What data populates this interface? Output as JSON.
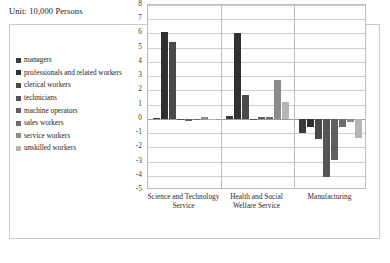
{
  "unit_label": "Unit: 10,000 Persons",
  "caption": "",
  "colors": {
    "series": [
      "#3b3b3b",
      "#303030",
      "#4a4a4a",
      "#555555",
      "#5f5f5f",
      "#6b6b6b",
      "#8c8c8c",
      "#b5b5b5"
    ],
    "gridline": "#cfcfcf",
    "axis": "#bdbdbd",
    "frame": "#c9c9c9"
  },
  "chart_data": {
    "type": "bar",
    "title": "",
    "subtitle": "",
    "xlabel": "",
    "ylabel": "",
    "unit": "10,000 Persons",
    "ylim": [
      -5,
      8
    ],
    "yticks": [
      8,
      7,
      6,
      5,
      4,
      3,
      2,
      1,
      0,
      -1,
      -2,
      -3,
      -4,
      -5
    ],
    "grid": true,
    "legend_position": "left",
    "categories": [
      "Science and Technology Service",
      "Health and Social Welfare Service",
      "Manufacturing"
    ],
    "series": [
      {
        "name": "managers",
        "values": [
          0.05,
          0.2,
          -1.0
        ]
      },
      {
        "name": "professionals and related workers",
        "values": [
          6.1,
          6.0,
          -0.6
        ]
      },
      {
        "name": "clerical workers",
        "values": [
          5.4,
          1.7,
          -1.4
        ]
      },
      {
        "name": "technicians",
        "values": [
          -0.1,
          -0.1,
          -4.1
        ]
      },
      {
        "name": "machine operators",
        "values": [
          -0.12,
          0.1,
          -2.9
        ]
      },
      {
        "name": "sales workers",
        "values": [
          -0.1,
          0.15,
          -0.55
        ]
      },
      {
        "name": "service workers",
        "values": [
          0.12,
          2.7,
          -0.2
        ]
      },
      {
        "name": "unskilled workers",
        "values": [
          -0.02,
          1.15,
          -1.35
        ]
      }
    ]
  }
}
